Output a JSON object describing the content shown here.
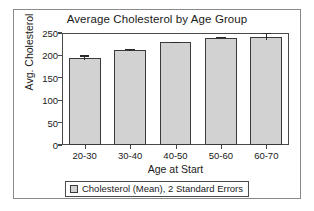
{
  "chart_data": {
    "type": "bar",
    "title": "Average Cholesterol by Age Group",
    "xlabel": "Age at Start",
    "ylabel": "Avg. Cholesterol",
    "categories": [
      "20-30",
      "30-40",
      "40-50",
      "50-60",
      "60-70"
    ],
    "values": [
      195,
      212,
      229,
      239,
      242
    ],
    "errors": [
      5.5,
      2.5,
      2.0,
      2.5,
      8.0
    ],
    "error_description": "2 Standard Errors",
    "ylim": [
      0,
      250
    ],
    "yticks": [
      0,
      50,
      100,
      150,
      200,
      250
    ],
    "ytick_labels": [
      "0",
      "50",
      "100",
      "150",
      "200",
      "250"
    ],
    "grid": false,
    "legend_position": "bottom",
    "legend": [
      "Cholesterol (Mean), 2 Standard Errors"
    ],
    "colors": {
      "bar_fill": "#d2d2d2",
      "bar_border": "#3a3a3a",
      "error_bar": "#2b2b2b",
      "axis": "#4a4a4a",
      "frame": "#8a8a8a",
      "text": "#1a1a1a",
      "background": "#ffffff"
    }
  }
}
